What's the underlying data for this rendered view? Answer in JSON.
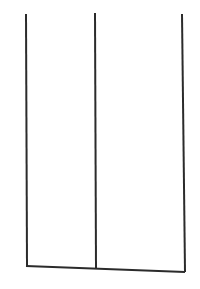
{
  "canvas": {
    "width": 200,
    "height": 289,
    "background_color": "#ffffff",
    "title": "Two-panel open frame line drawing"
  },
  "drawing": {
    "stroke_color": "#2b2b2b",
    "stroke_width": 2,
    "description": "Three near-vertical lines joined at the bottom by a single slightly downward-sloping horizontal line, forming two open-topped rectangular panels.",
    "strokes": [
      {
        "name": "left-vertical-line",
        "type": "line",
        "x1": 26,
        "y1": 14,
        "x2": 27,
        "y2": 266
      },
      {
        "name": "middle-vertical-line",
        "type": "line",
        "x1": 95,
        "y1": 13,
        "x2": 96,
        "y2": 269
      },
      {
        "name": "right-vertical-line",
        "type": "line",
        "x1": 182,
        "y1": 14,
        "x2": 185,
        "y2": 272
      },
      {
        "name": "bottom-horizontal-line",
        "type": "line",
        "x1": 26,
        "y1": 266,
        "x2": 185,
        "y2": 272
      }
    ],
    "panels": [
      {
        "name": "left-panel",
        "left_edge": "left-vertical-line",
        "right_edge": "middle-vertical-line",
        "bottom_edge": "bottom-horizontal-line",
        "top_edge": "open"
      },
      {
        "name": "right-panel",
        "left_edge": "middle-vertical-line",
        "right_edge": "right-vertical-line",
        "bottom_edge": "bottom-horizontal-line",
        "top_edge": "open"
      }
    ]
  }
}
